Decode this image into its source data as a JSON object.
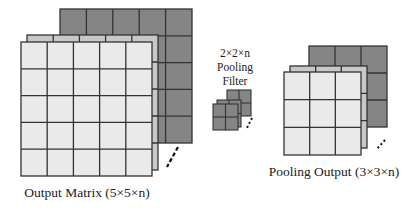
{
  "diagram": {
    "output_matrix": {
      "label": "Output Matrix (5×5×n)",
      "rows": 5,
      "cols": 5
    },
    "pooling_filter": {
      "label_lines": [
        "2×2×n",
        "Pooling",
        "Filter"
      ],
      "rows": 2,
      "cols": 2
    },
    "pooling_output": {
      "label": "Pooling Output (3×3×n)",
      "rows": 3,
      "cols": 3
    },
    "colors": {
      "front": "#eaeaea",
      "middle": "#c8c8c8",
      "back": "#858585",
      "filter": "#858585",
      "grid": "#333333"
    }
  }
}
